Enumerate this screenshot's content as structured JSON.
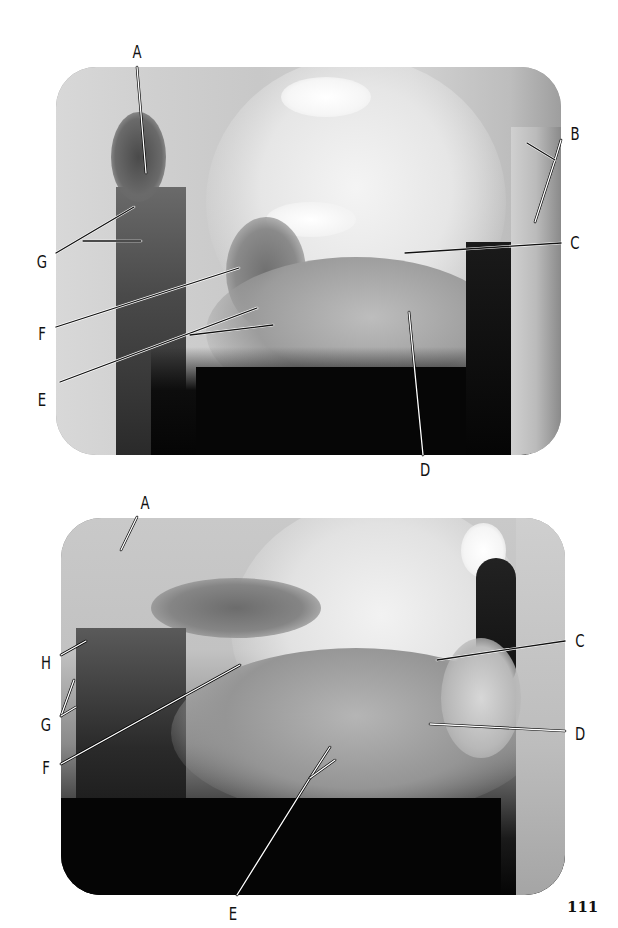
{
  "page": {
    "number": "111",
    "background": "#ffffff"
  },
  "figures": [
    {
      "id": "top-radiograph",
      "description": "Lateral oblique jaw radiograph (upper plate)",
      "labels": [
        {
          "text": "A",
          "x": 137,
          "y": 52
        },
        {
          "text": "B",
          "x": 575,
          "y": 134
        },
        {
          "text": "C",
          "x": 575,
          "y": 243
        },
        {
          "text": "G",
          "x": 42,
          "y": 262
        },
        {
          "text": "F",
          "x": 42,
          "y": 334
        },
        {
          "text": "E",
          "x": 42,
          "y": 400
        },
        {
          "text": "D",
          "x": 425,
          "y": 470
        }
      ],
      "leader_lines": [
        {
          "label": "A",
          "points": [
            [
              137,
              67
            ],
            [
              146,
              173
            ]
          ],
          "color": "#ffffff",
          "shadow": "#000000"
        },
        {
          "label": "B",
          "points": [
            [
              561,
              140
            ],
            [
              555,
              160
            ],
            [
              535,
              222
            ]
          ],
          "color": "#ffffff",
          "shadow": "#000000"
        },
        {
          "label": "B",
          "points": [
            [
              527,
              143
            ],
            [
              555,
              160
            ]
          ],
          "color": "#111111",
          "shadow": "#ffffff"
        },
        {
          "label": "C",
          "points": [
            [
              405,
              253
            ],
            [
              561,
              243
            ]
          ],
          "color": "#111111",
          "shadow": "#ffffff"
        },
        {
          "label": "D",
          "points": [
            [
              409,
              312
            ],
            [
              423,
              455
            ]
          ],
          "color": "#ffffff",
          "shadow": "#000000"
        },
        {
          "label": "G",
          "points": [
            [
              56,
              253
            ],
            [
              134,
              207
            ]
          ],
          "color": "#111111",
          "shadow": "#ffffff"
        },
        {
          "label": "G",
          "points": [
            [
              83,
              241
            ],
            [
              141,
              241
            ]
          ],
          "color": "#111111",
          "shadow": "#ffffff"
        },
        {
          "label": "F",
          "points": [
            [
              56,
              327
            ],
            [
              239,
              268
            ]
          ],
          "color": "#111111",
          "shadow": "#ffffff"
        },
        {
          "label": "E",
          "points": [
            [
              60,
              382
            ],
            [
              257,
              308
            ]
          ],
          "color": "#111111",
          "shadow": "#ffffff"
        },
        {
          "label": "E",
          "points": [
            [
              190,
              335
            ],
            [
              273,
              325
            ]
          ],
          "color": "#111111",
          "shadow": "#ffffff"
        }
      ]
    },
    {
      "id": "bottom-radiograph",
      "description": "Lateral oblique jaw radiograph (lower plate)",
      "labels": [
        {
          "text": "A",
          "x": 145,
          "y": 503
        },
        {
          "text": "C",
          "x": 580,
          "y": 641
        },
        {
          "text": "H",
          "x": 46,
          "y": 663
        },
        {
          "text": "G",
          "x": 46,
          "y": 725
        },
        {
          "text": "D",
          "x": 580,
          "y": 734
        },
        {
          "text": "F",
          "x": 46,
          "y": 768
        },
        {
          "text": "E",
          "x": 233,
          "y": 914
        }
      ],
      "leader_lines": [
        {
          "label": "A",
          "points": [
            [
              137,
              517
            ],
            [
              121,
              550
            ]
          ],
          "color": "#ffffff",
          "shadow": "#000000"
        },
        {
          "label": "C",
          "points": [
            [
              437,
              660
            ],
            [
              565,
              641
            ]
          ],
          "color": "#111111",
          "shadow": "#ffffff"
        },
        {
          "label": "D",
          "points": [
            [
              430,
              724
            ],
            [
              565,
              731
            ]
          ],
          "color": "#ffffff",
          "shadow": "#000000"
        },
        {
          "label": "H",
          "points": [
            [
              61,
              655
            ],
            [
              86,
              641
            ]
          ],
          "color": "#ffffff",
          "shadow": "#000000"
        },
        {
          "label": "G",
          "points": [
            [
              61,
              716
            ],
            [
              74,
              680
            ]
          ],
          "color": "#ffffff",
          "shadow": "#000000"
        },
        {
          "label": "G",
          "points": [
            [
              61,
              716
            ],
            [
              76,
              707
            ]
          ],
          "color": "#ffffff",
          "shadow": "#000000"
        },
        {
          "label": "F",
          "points": [
            [
              61,
              764
            ],
            [
              240,
              665
            ]
          ],
          "color": "#ffffff",
          "shadow": "#000000"
        },
        {
          "label": "E",
          "points": [
            [
              237,
              895
            ],
            [
              310,
              778
            ],
            [
              330,
              747
            ]
          ],
          "color": "#ffffff",
          "shadow": "#000000"
        },
        {
          "label": "E",
          "points": [
            [
              310,
              778
            ],
            [
              335,
              760
            ]
          ],
          "color": "#ffffff",
          "shadow": "#000000"
        }
      ]
    }
  ]
}
